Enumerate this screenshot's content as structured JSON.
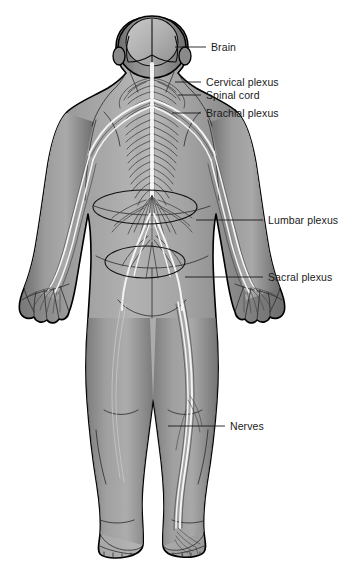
{
  "diagram": {
    "view": "posterior",
    "background_color": "#ffffff",
    "body_fill_color": "#8d8d8d",
    "body_outline_color": "#000000",
    "nerve_highlight_color": "#f4f4f4",
    "label_color": "#1a1a1a",
    "leader_color": "#1a1a1a"
  },
  "labels": [
    {
      "id": "brain",
      "text": "Brain",
      "text_x": 211,
      "text_y": 51,
      "leader_x1": 175,
      "leader_y1": 47,
      "leader_x2": 206,
      "leader_y2": 47
    },
    {
      "id": "cervical-plexus",
      "text": "Cervical plexus",
      "text_x": 206,
      "text_y": 86,
      "leader_x1": 175,
      "leader_y1": 82,
      "leader_x2": 201,
      "leader_y2": 82
    },
    {
      "id": "spinal-cord",
      "text": "Spinal cord",
      "text_x": 206,
      "text_y": 99,
      "leader_x1": 145,
      "leader_y1": 95,
      "leader_x2": 201,
      "leader_y2": 95
    },
    {
      "id": "brachial-plexus",
      "text": "Brachial plexus",
      "text_x": 206,
      "text_y": 117,
      "leader_x1": 160,
      "leader_y1": 113,
      "leader_x2": 201,
      "leader_y2": 113
    },
    {
      "id": "lumbar-plexus",
      "text": "Lumbar plexus",
      "text_x": 268,
      "text_y": 224,
      "leader_x1": 203,
      "leader_y1": 220,
      "leader_x2": 263,
      "leader_y2": 220
    },
    {
      "id": "sacral-plexus",
      "text": "Sacral plexus",
      "text_x": 268,
      "text_y": 281,
      "leader_x1": 198,
      "leader_y1": 277,
      "leader_x2": 263,
      "leader_y2": 277
    },
    {
      "id": "nerves",
      "text": "Nerves",
      "text_x": 230,
      "text_y": 430,
      "leader_x1": 168,
      "leader_y1": 426,
      "leader_x2": 225,
      "leader_y2": 426
    }
  ],
  "callouts": [
    {
      "id": "lumbar-plexus-ellipse",
      "cx": 145,
      "cy": 207,
      "rx": 52,
      "ry": 17
    },
    {
      "id": "sacral-plexus-ellipse",
      "cx": 145,
      "cy": 262,
      "rx": 40,
      "ry": 16
    }
  ],
  "anatomy_parts": [
    "head",
    "brain-left-hemisphere",
    "brain-right-hemisphere",
    "cerebellum",
    "spinal-cord",
    "spinal-nerves",
    "cervical-plexus",
    "brachial-plexus",
    "cauda-equina",
    "lumbar-plexus",
    "sacral-plexus",
    "left-arm",
    "right-arm",
    "left-hand",
    "right-hand",
    "torso",
    "left-leg",
    "right-leg",
    "sciatic-nerve",
    "left-foot",
    "right-foot"
  ]
}
